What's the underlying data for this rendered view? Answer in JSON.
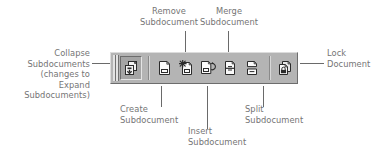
{
  "figure": {
    "type": "annotated-toolbar-diagram",
    "background_color": "#ffffff",
    "label_color": "#757575",
    "leader_color": "#6a6a6a"
  },
  "toolbar": {
    "name": "master-document-toolbar",
    "background_color": "#b4b4b4",
    "buttons": [
      {
        "id": "collapse-subdocuments",
        "icon": "collapse-subdocuments-icon",
        "state": "pressed",
        "tooltip": "Collapse Subdocuments"
      },
      {
        "id": "create-subdocument",
        "icon": "create-subdocument-icon",
        "state": "normal",
        "tooltip": "Create Subdocument"
      },
      {
        "id": "remove-subdocument",
        "icon": "remove-subdocument-icon",
        "state": "normal",
        "tooltip": "Remove Subdocument"
      },
      {
        "id": "insert-subdocument",
        "icon": "insert-subdocument-icon",
        "state": "normal",
        "tooltip": "Insert Subdocument"
      },
      {
        "id": "merge-subdocument",
        "icon": "merge-subdocument-icon",
        "state": "normal",
        "tooltip": "Merge Subdocument"
      },
      {
        "id": "split-subdocument",
        "icon": "split-subdocument-icon",
        "state": "normal",
        "tooltip": "Split Subdocument"
      },
      {
        "id": "lock-document",
        "icon": "lock-document-icon",
        "state": "normal",
        "tooltip": "Lock Document"
      }
    ]
  },
  "callouts": {
    "collapse": "Collapse\nSubdocuments\n(changes to\nExpand\nSubdocuments)",
    "create": "Create\nSubdocument",
    "remove": "Remove\nSubdocument",
    "insert": "Insert\nSubdocument",
    "merge": "Merge\nSubdocument",
    "split": "Split\nSubdocument",
    "lock": "Lock\nDocument"
  }
}
